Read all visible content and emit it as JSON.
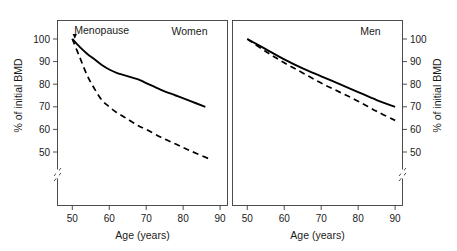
{
  "figure": {
    "background_color": "#ffffff",
    "line_color": "#000000",
    "axis_color": "#3a3a3a"
  },
  "chart_data": {
    "type": "line",
    "title": "",
    "panels": [
      {
        "name": "women-panel",
        "title": "Women",
        "xlabel": "Age (years)",
        "ylabel": "% of initial BMD",
        "xlim": [
          46,
          92
        ],
        "ylim": [
          40,
          104
        ],
        "xticks": [
          50,
          60,
          70,
          80,
          90
        ],
        "xtick_labels": [
          "50",
          "60",
          "70",
          "80",
          "90"
        ],
        "yticks": [
          50,
          60,
          70,
          80,
          90,
          100
        ],
        "ytick_labels": [
          "50",
          "60",
          "70",
          "80",
          "90",
          "100"
        ],
        "axis_break": true,
        "axis_break_below": 50,
        "y_axis_side": "left",
        "grid": false,
        "legend": "none",
        "annotations": [
          {
            "text": "Menopause",
            "x": 50,
            "y": 103,
            "arrow_to_x": 50,
            "arrow_to_y": 100
          }
        ],
        "series": [
          {
            "name": "solid-curve-women",
            "style": "solid",
            "x": [
              50,
              52,
              54,
              56,
              58,
              60,
              62,
              64,
              66,
              68,
              70,
              74,
              78,
              82,
              86
            ],
            "values": [
              100,
              96.5,
              93.5,
              91,
              88.5,
              86.5,
              85,
              84,
              83,
              82,
              80.5,
              77.5,
              75,
              72.5,
              70
            ]
          },
          {
            "name": "dashed-curve-women",
            "style": "dashed",
            "x": [
              50,
              52,
              54,
              56,
              58,
              60,
              62,
              64,
              66,
              68,
              70,
              74,
              78,
              82,
              87
            ],
            "values": [
              100,
              92,
              84,
              78,
              73,
              70,
              67.5,
              65.5,
              63.5,
              61.5,
              60,
              56.5,
              53.5,
              50.5,
              47
            ]
          }
        ]
      },
      {
        "name": "men-panel",
        "title": "Men",
        "xlabel": "Age (years)",
        "ylabel": "% of initial BMD",
        "xlim": [
          46,
          92
        ],
        "ylim": [
          40,
          104
        ],
        "xticks": [
          50,
          60,
          70,
          80,
          90
        ],
        "xtick_labels": [
          "50",
          "60",
          "70",
          "80",
          "90"
        ],
        "yticks": [
          50,
          60,
          70,
          80,
          90,
          100
        ],
        "ytick_labels": [
          "50",
          "60",
          "70",
          "80",
          "90",
          "100"
        ],
        "axis_break": true,
        "axis_break_below": 50,
        "y_axis_side": "right",
        "grid": false,
        "legend": "none",
        "annotations": [],
        "series": [
          {
            "name": "solid-curve-men",
            "style": "solid",
            "x": [
              50,
              55,
              60,
              65,
              70,
              75,
              80,
              85,
              90
            ],
            "values": [
              100,
              95.5,
              91,
              87,
              83.5,
              80,
              76.5,
              73,
              70
            ]
          },
          {
            "name": "dashed-curve-men",
            "style": "dashed",
            "x": [
              50,
              55,
              60,
              65,
              70,
              75,
              80,
              85,
              90
            ],
            "values": [
              100,
              94.5,
              89.5,
              85,
              80.5,
              76.5,
              72.5,
              68,
              64
            ]
          }
        ]
      }
    ]
  }
}
